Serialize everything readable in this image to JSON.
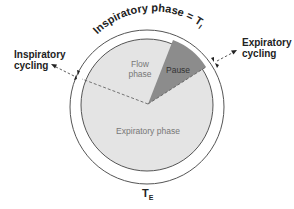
{
  "diagram": {
    "type": "pie-cycle",
    "title_arc": "Inspiratory  phase = T",
    "title_sub": "I",
    "bottom_label": "T",
    "bottom_sub": "E",
    "segments": [
      {
        "name": "Flow phase",
        "line1": "Flow",
        "line2": "phase",
        "color": "#e4e4e4"
      },
      {
        "name": "Pause",
        "label": "Pause",
        "color": "#8c8c8c"
      },
      {
        "name": "Expiratory phase",
        "label": "Expiratory phase",
        "color": "#e4e4e4"
      }
    ],
    "annotations": {
      "left": {
        "line1": "Inspiratory",
        "line2": "cycling"
      },
      "right": {
        "line1": "Expiratory",
        "line2": "cycling"
      }
    },
    "colors": {
      "ring": "#555555",
      "pie_light": "#e4e4e4",
      "pause": "#8c8c8c",
      "text": "#222222",
      "inner_text": "#777777"
    }
  }
}
